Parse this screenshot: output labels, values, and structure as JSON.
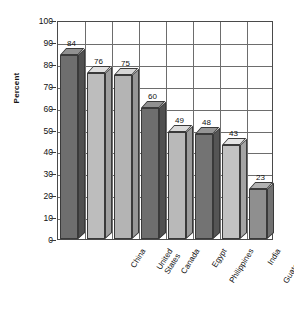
{
  "chart_data": {
    "type": "bar",
    "title": "",
    "xlabel": "",
    "ylabel": "Percent",
    "ylim": [
      0,
      100
    ],
    "ytick_step": 10,
    "grid": true,
    "legend": "none",
    "style": "3d-bars",
    "categories": [
      "China",
      "United States",
      "Canada",
      "Egypt",
      "Philippines",
      "India",
      "Guatemala",
      "Uganda"
    ],
    "category_lines": [
      [
        "China"
      ],
      [
        "United",
        "States"
      ],
      [
        "Canada"
      ],
      [
        "Egypt"
      ],
      [
        "Philippines"
      ],
      [
        "India"
      ],
      [
        "Guatemala"
      ],
      [
        "Uganda"
      ]
    ],
    "values": [
      84,
      76,
      75,
      60,
      49,
      48,
      43,
      23
    ],
    "value_labels": [
      "84",
      "76",
      "75",
      "60",
      "49",
      "48",
      "43",
      "23"
    ],
    "bar_colors": [
      "#6e6e6e",
      "#bdbdbd",
      "#b4b4b4",
      "#6e6e6e",
      "#b9b9b9",
      "#737373",
      "#c2c2c2",
      "#8f8f8f"
    ],
    "ytick_labels": [
      "100",
      "90",
      "80",
      "70",
      "60",
      "50",
      "40",
      "30",
      "20",
      "10",
      "0"
    ]
  },
  "axis": {
    "y_title": "Percent"
  },
  "header": {
    "title_cut_off": ""
  },
  "colors": {
    "grid": "#6d6d6d",
    "frame": "#4a4a4a",
    "text": "#111111",
    "background": "#ffffff"
  }
}
